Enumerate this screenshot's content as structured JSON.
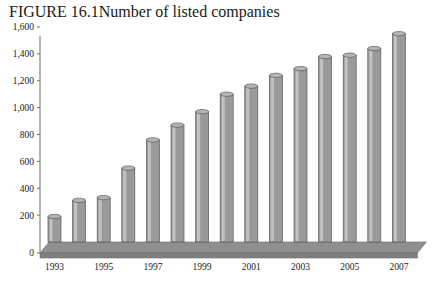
{
  "figure": {
    "label": "FIGURE 16.1",
    "title": "Number of listed companies"
  },
  "chart_data": {
    "type": "bar",
    "title": "Number of listed companies",
    "xlabel": "",
    "ylabel": "",
    "ylim": [
      0,
      1600
    ],
    "ytick_labels": [
      "0",
      "200",
      "400",
      "600",
      "800",
      "1,000",
      "1,200",
      "1,400",
      "1,600"
    ],
    "ytick_values": [
      0,
      200,
      400,
      600,
      800,
      1000,
      1200,
      1400,
      1600
    ],
    "grid": false,
    "legend": "none",
    "categories": [
      1993,
      1994,
      1995,
      1996,
      1997,
      1998,
      1999,
      2000,
      2001,
      2002,
      2003,
      2004,
      2005,
      2006,
      2007
    ],
    "xtick_labels": [
      "1993",
      "1995",
      "1997",
      "1999",
      "2001",
      "2003",
      "2005",
      "2007"
    ],
    "xtick_categories": [
      1993,
      1995,
      1997,
      1999,
      2001,
      2003,
      2005,
      2007
    ],
    "values": [
      190,
      310,
      330,
      550,
      760,
      870,
      970,
      1100,
      1160,
      1240,
      1290,
      1380,
      1390,
      1440,
      1550
    ],
    "series": [
      {
        "name": "Number of listed companies",
        "values": [
          190,
          310,
          330,
          550,
          760,
          870,
          970,
          1100,
          1160,
          1240,
          1290,
          1380,
          1390,
          1440,
          1550
        ]
      }
    ],
    "style": {
      "bar_fill": "#9a9a9a",
      "bar_highlight": "#c9c9c9",
      "bar_edge": "#5a5a5a",
      "bar_top": "#b4b4b4",
      "floor": "#8f8f8f",
      "axis": "#6d6d6d"
    }
  }
}
